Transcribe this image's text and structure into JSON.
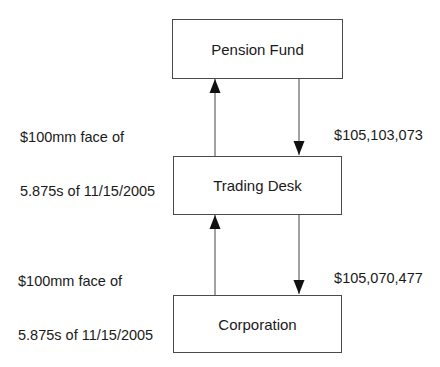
{
  "diagram": {
    "nodes": [
      {
        "id": "pension-fund",
        "label": "Pension Fund"
      },
      {
        "id": "trading-desk",
        "label": "Trading Desk"
      },
      {
        "id": "corporation",
        "label": "Corporation"
      }
    ],
    "edges": [
      {
        "from": "trading-desk",
        "to": "pension-fund",
        "label_line1": "$100mm face of",
        "label_line2": "5.875s of 11/15/2005"
      },
      {
        "from": "pension-fund",
        "to": "trading-desk",
        "label": "$105,103,073"
      },
      {
        "from": "corporation",
        "to": "trading-desk",
        "label_line1": "$100mm face of",
        "label_line2": "5.875s of 11/15/2005"
      },
      {
        "from": "trading-desk",
        "to": "corporation",
        "label": "$105,070,477"
      }
    ]
  }
}
